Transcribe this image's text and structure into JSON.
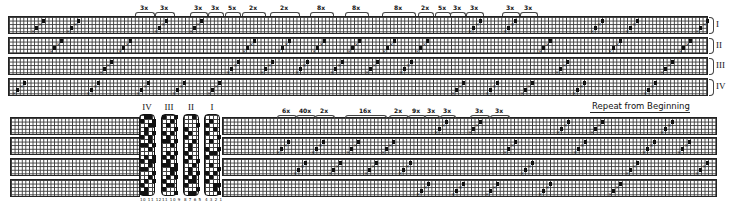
{
  "diagram": {
    "type": "weaving-draft",
    "colors": {
      "ink": "#111111",
      "grid": "#3a3a3a",
      "paper": "#ffffff"
    },
    "top_block": {
      "rows": [
        {
          "label": "I",
          "y": 16,
          "h": 18
        },
        {
          "label": "II",
          "y": 37,
          "h": 17
        },
        {
          "label": "III",
          "y": 57,
          "h": 18
        },
        {
          "label": "IV",
          "y": 78,
          "h": 18
        }
      ],
      "x": 8,
      "w": 700,
      "side_labels": [
        "I",
        "II",
        "III",
        "IV"
      ],
      "repeat_marks": [
        {
          "label": "3x",
          "x": 135,
          "w": 18
        },
        {
          "label": "3x",
          "x": 155,
          "w": 18
        },
        {
          "label": "3x",
          "x": 190,
          "w": 16
        },
        {
          "label": "3x",
          "x": 208,
          "w": 14
        },
        {
          "label": "5x",
          "x": 225,
          "w": 14
        },
        {
          "label": "2x",
          "x": 242,
          "w": 22
        },
        {
          "label": "2x",
          "x": 270,
          "w": 28
        },
        {
          "label": "8x",
          "x": 310,
          "w": 22
        },
        {
          "label": "8x",
          "x": 345,
          "w": 22
        },
        {
          "label": "8x",
          "x": 382,
          "w": 32
        },
        {
          "label": "2x",
          "x": 418,
          "w": 14
        },
        {
          "label": "5x",
          "x": 435,
          "w": 14
        },
        {
          "label": "3x",
          "x": 450,
          "w": 14
        },
        {
          "label": "3x",
          "x": 466,
          "w": 16
        },
        {
          "label": "3x",
          "x": 502,
          "w": 16
        },
        {
          "label": "3x",
          "x": 520,
          "w": 16
        }
      ],
      "runs": [
        {
          "row": 0,
          "x": 31
        },
        {
          "row": 0,
          "x": 66
        },
        {
          "row": 0,
          "x": 154
        },
        {
          "row": 0,
          "x": 189
        },
        {
          "row": 0,
          "x": 468
        },
        {
          "row": 0,
          "x": 503
        },
        {
          "row": 0,
          "x": 590
        },
        {
          "row": 0,
          "x": 625
        },
        {
          "row": 0,
          "x": 695
        },
        {
          "row": 1,
          "x": 49
        },
        {
          "row": 1,
          "x": 118
        },
        {
          "row": 1,
          "x": 242
        },
        {
          "row": 1,
          "x": 277
        },
        {
          "row": 1,
          "x": 312
        },
        {
          "row": 1,
          "x": 347
        },
        {
          "row": 1,
          "x": 382
        },
        {
          "row": 1,
          "x": 415
        },
        {
          "row": 1,
          "x": 538
        },
        {
          "row": 1,
          "x": 608
        },
        {
          "row": 1,
          "x": 678
        },
        {
          "row": 2,
          "x": 99
        },
        {
          "row": 2,
          "x": 226
        },
        {
          "row": 2,
          "x": 260
        },
        {
          "row": 2,
          "x": 295
        },
        {
          "row": 2,
          "x": 330
        },
        {
          "row": 2,
          "x": 365
        },
        {
          "row": 2,
          "x": 399
        },
        {
          "row": 2,
          "x": 555
        },
        {
          "row": 2,
          "x": 660
        },
        {
          "row": 3,
          "x": 12
        },
        {
          "row": 3,
          "x": 86
        },
        {
          "row": 3,
          "x": 136
        },
        {
          "row": 3,
          "x": 172
        },
        {
          "row": 3,
          "x": 207
        },
        {
          "row": 3,
          "x": 451
        },
        {
          "row": 3,
          "x": 485
        },
        {
          "row": 3,
          "x": 520
        },
        {
          "row": 3,
          "x": 572
        },
        {
          "row": 3,
          "x": 643
        }
      ]
    },
    "bottom_block": {
      "rows": [
        {
          "y": 117,
          "h": 18
        },
        {
          "y": 137,
          "h": 18
        },
        {
          "y": 158,
          "h": 18
        },
        {
          "y": 179,
          "h": 18
        }
      ],
      "left_x": 10,
      "left_w": 130,
      "right_x": 222,
      "right_w": 495,
      "repeat_marks": [
        {
          "label": "6x",
          "x": 277,
          "w": 18
        },
        {
          "label": "40x",
          "x": 296,
          "w": 18
        },
        {
          "label": "2x",
          "x": 315,
          "w": 18
        },
        {
          "label": "16x",
          "x": 345,
          "w": 40
        },
        {
          "label": "2x",
          "x": 389,
          "w": 18
        },
        {
          "label": "9x",
          "x": 408,
          "w": 16
        },
        {
          "label": "3x",
          "x": 424,
          "w": 14
        },
        {
          "label": "3x",
          "x": 440,
          "w": 14
        },
        {
          "label": "3x",
          "x": 470,
          "w": 18
        },
        {
          "label": "3x",
          "x": 490,
          "w": 18
        }
      ],
      "runs": [
        {
          "row": 0,
          "x": 434
        },
        {
          "row": 0,
          "x": 468
        },
        {
          "row": 0,
          "x": 556
        },
        {
          "row": 0,
          "x": 590
        },
        {
          "row": 0,
          "x": 660
        },
        {
          "row": 1,
          "x": 276
        },
        {
          "row": 1,
          "x": 311
        },
        {
          "row": 1,
          "x": 346
        },
        {
          "row": 1,
          "x": 381
        },
        {
          "row": 1,
          "x": 503
        },
        {
          "row": 1,
          "x": 573
        },
        {
          "row": 1,
          "x": 642
        },
        {
          "row": 1,
          "x": 677
        },
        {
          "row": 2,
          "x": 293
        },
        {
          "row": 2,
          "x": 328
        },
        {
          "row": 2,
          "x": 364
        },
        {
          "row": 2,
          "x": 398
        },
        {
          "row": 2,
          "x": 520
        },
        {
          "row": 2,
          "x": 625
        },
        {
          "row": 2,
          "x": 695
        },
        {
          "row": 3,
          "x": 416
        },
        {
          "row": 3,
          "x": 451
        },
        {
          "row": 3,
          "x": 485
        },
        {
          "row": 3,
          "x": 538
        },
        {
          "row": 3,
          "x": 608
        }
      ],
      "repeat_note": {
        "label": "Repeat from Beginning",
        "x": 592,
        "y": 101,
        "line_x": 590,
        "line_w": 100
      }
    },
    "tieups": [
      {
        "label": "IV",
        "x": 139,
        "numbers": "10 11 12"
      },
      {
        "label": "III",
        "x": 161,
        "numbers": "11 10 9"
      },
      {
        "label": "II",
        "x": 183,
        "numbers": "8 7 6 5"
      },
      {
        "label": "I",
        "x": 204,
        "numbers": "4 3 2 1"
      }
    ],
    "tieup_geom": {
      "y": 114,
      "w": 16,
      "h": 82
    }
  }
}
